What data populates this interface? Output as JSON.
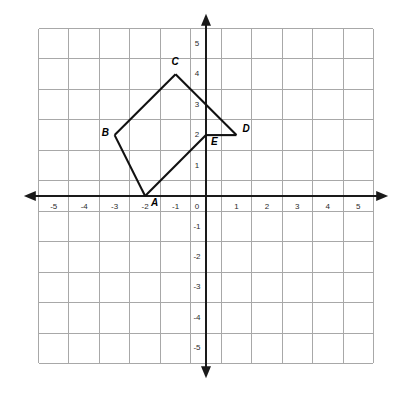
{
  "chart_data": {
    "type": "scatter",
    "title": "",
    "xlabel": "",
    "ylabel": "",
    "xlim": [
      -5.5,
      5.5
    ],
    "ylim": [
      -5.5,
      5.5
    ],
    "grid": true,
    "legend": "none",
    "x_ticks": [
      "-5",
      "-4",
      "-3",
      "-2",
      "-1",
      "0",
      "1",
      "2",
      "3",
      "4",
      "5"
    ],
    "y_ticks": [
      "5",
      "4",
      "3",
      "2",
      "1",
      "0",
      "-1",
      "-2",
      "-3",
      "-4",
      "-5"
    ],
    "x_tick_values": [
      -5,
      -4,
      -3,
      -2,
      -1,
      0,
      1,
      2,
      3,
      4,
      5
    ],
    "y_tick_values": [
      5,
      4,
      3,
      2,
      1,
      0,
      -1,
      -2,
      -3,
      -4,
      -5
    ],
    "points": [
      {
        "label": "A",
        "x": -2,
        "y": 0,
        "label_dx": 6,
        "label_dy": 7
      },
      {
        "label": "B",
        "x": -3,
        "y": 2,
        "label_dx": -13,
        "label_dy": -2
      },
      {
        "label": "C",
        "x": -1,
        "y": 4,
        "label_dx": -4,
        "label_dy": -12
      },
      {
        "label": "D",
        "x": 1,
        "y": 2,
        "label_dx": 6,
        "label_dy": -6
      },
      {
        "label": "E",
        "x": 0,
        "y": 2,
        "label_dx": 5,
        "label_dy": 7
      }
    ],
    "polygon_order": [
      "A",
      "B",
      "C",
      "D",
      "E"
    ],
    "edges": [
      {
        "from": "A",
        "to": "B"
      },
      {
        "from": "B",
        "to": "C"
      },
      {
        "from": "C",
        "to": "D"
      },
      {
        "from": "D",
        "to": "E"
      },
      {
        "from": "E",
        "to": "A"
      }
    ],
    "colors": {
      "background": "#ffffff",
      "grid": "#a8a8a8",
      "axis": "#1a1a1a",
      "shape_stroke": "#111111",
      "tick_text": "#2b2b2b",
      "vertex_text": "#000000"
    },
    "geometry": {
      "origin_x_px": 206,
      "origin_y_px": 196,
      "cell_px": 30.45,
      "grid_min": -5.5,
      "grid_max": 5.5,
      "axis_extent": 5.95
    }
  }
}
